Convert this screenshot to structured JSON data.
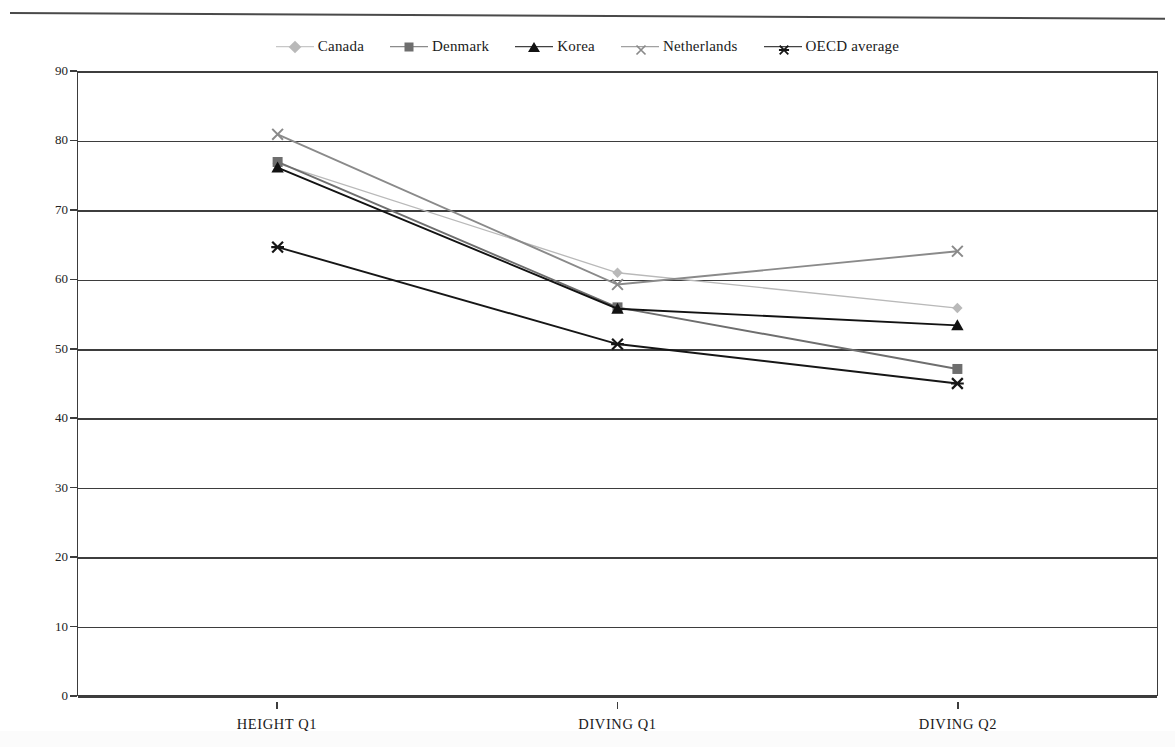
{
  "chart_data": {
    "type": "line",
    "title": "",
    "xlabel": "",
    "ylabel": "Percent correct",
    "categories": [
      "HEIGHT Q1",
      "DIVING Q1",
      "DIVING Q2"
    ],
    "ylim": [
      0,
      90
    ],
    "yticks": [
      0,
      10,
      20,
      30,
      40,
      50,
      60,
      70,
      80,
      90
    ],
    "grid": true,
    "legend_position": "top-center",
    "series": [
      {
        "name": "Canada",
        "marker": "diamond",
        "color": "#b9b9b9",
        "values": [
          76.8,
          61.0,
          55.9
        ]
      },
      {
        "name": "Denmark",
        "marker": "square",
        "color": "#6e6e6e",
        "values": [
          77.0,
          56.0,
          47.1
        ]
      },
      {
        "name": "Korea",
        "marker": "triangle",
        "color": "#121212",
        "values": [
          76.2,
          55.8,
          53.4
        ]
      },
      {
        "name": "Netherlands",
        "marker": "x",
        "color": "#8a8a8a",
        "values": [
          81.0,
          59.3,
          64.1
        ]
      },
      {
        "name": "OECD average",
        "marker": "star",
        "color": "#161616",
        "values": [
          64.7,
          50.7,
          45.0
        ]
      }
    ]
  },
  "legend": {
    "items": [
      {
        "label": "Canada"
      },
      {
        "label": "Denmark"
      },
      {
        "label": "Korea"
      },
      {
        "label": "Netherlands"
      },
      {
        "label": "OECD average"
      }
    ]
  },
  "axis": {
    "y_title": "Percent correct",
    "y_tick_labels": [
      "90",
      "80",
      "70",
      "60",
      "50",
      "40",
      "30",
      "20",
      "10",
      "0"
    ],
    "x_tick_labels": [
      "HEIGHT Q1",
      "DIVING Q1",
      "DIVING Q2"
    ]
  }
}
